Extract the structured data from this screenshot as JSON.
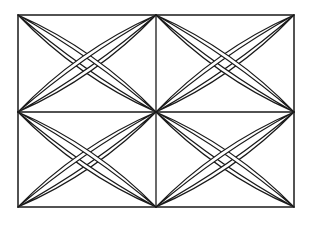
{
  "figure": {
    "stroke_color": "#1a1a1a",
    "background_color": "#ffffff",
    "frame": {
      "x": 18,
      "y": 15,
      "width": 276,
      "height": 192
    },
    "center": {
      "x": 156,
      "y": 112
    },
    "quadrants": [
      "top-left",
      "top-right",
      "bottom-left",
      "bottom-right"
    ]
  }
}
